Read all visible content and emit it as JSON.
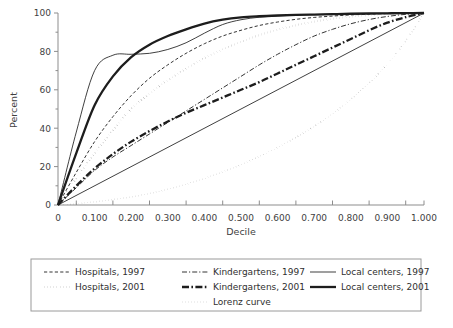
{
  "chart_data": {
    "type": "line",
    "title": "",
    "xlabel": "Decile",
    "ylabel": "Percent",
    "xlim": [
      0,
      1.0
    ],
    "ylim": [
      0,
      100
    ],
    "grid": false,
    "legend_position": "bottom",
    "xticks": [
      "0",
      "0.100",
      "0.200",
      "0.300",
      "0.400",
      "0.500",
      "0.600",
      "0.700",
      "0.800",
      "0.900",
      "1.000"
    ],
    "xtick_values": [
      0,
      0.1,
      0.2,
      0.3,
      0.4,
      0.5,
      0.6,
      0.7,
      0.8,
      0.9,
      1.0
    ],
    "yticks": [
      "0",
      "20",
      "40",
      "60",
      "80",
      "100"
    ],
    "ytick_values": [
      0,
      20,
      40,
      60,
      80,
      100
    ],
    "x": [
      0,
      0.05,
      0.1,
      0.15,
      0.2,
      0.25,
      0.3,
      0.35,
      0.4,
      0.45,
      0.5,
      0.55,
      0.6,
      0.65,
      0.7,
      0.75,
      0.8,
      0.85,
      0.9,
      0.95,
      1.0
    ],
    "series": [
      {
        "name": "Hospitals, 1997",
        "style": "thin-dashed",
        "values": [
          0,
          17,
          33,
          46,
          57,
          66,
          73,
          79,
          84,
          88,
          91,
          93.5,
          95.3,
          96.7,
          97.7,
          98.4,
          99,
          99.4,
          99.7,
          99.9,
          100
        ]
      },
      {
        "name": "Hospitals, 2001",
        "style": "thick-dotted",
        "values": [
          0,
          14,
          27,
          39,
          50,
          58,
          65,
          71,
          76.5,
          81,
          85,
          88.5,
          91.3,
          93.6,
          95.5,
          97,
          98.1,
          98.9,
          99.5,
          99.85,
          100
        ]
      },
      {
        "name": "Kindergartens, 1997",
        "style": "thin-dashdot",
        "values": [
          0,
          9,
          18,
          25,
          31,
          37,
          43,
          49,
          55,
          61,
          67,
          73,
          78.5,
          83.5,
          88,
          91.5,
          94.4,
          96.6,
          98.2,
          99.3,
          100
        ]
      },
      {
        "name": "Kindergartens, 2001",
        "style": "thick-dashdot",
        "values": [
          0,
          10,
          19,
          26.5,
          33,
          38.5,
          43.5,
          48,
          52,
          56,
          60,
          64,
          68.5,
          73,
          77.5,
          82,
          86.5,
          91,
          95,
          97.8,
          100
        ]
      },
      {
        "name": "Local centers, 1997",
        "style": "thin-solid",
        "values": [
          0,
          38,
          70,
          78,
          78.5,
          79,
          81,
          84.5,
          89.5,
          94,
          96.5,
          97.8,
          98.5,
          98.9,
          99.2,
          99.4,
          99.6,
          99.75,
          99.85,
          99.95,
          100
        ]
      },
      {
        "name": "Local centers, 2001",
        "style": "thick-solid",
        "values": [
          0,
          27,
          52,
          67,
          77,
          83.5,
          88,
          91.5,
          94.5,
          96.5,
          97.7,
          98.3,
          98.7,
          99,
          99.2,
          99.4,
          99.6,
          99.75,
          99.85,
          99.95,
          100
        ]
      },
      {
        "name": "Lorenz curve",
        "style": "thin-dotted",
        "values": [
          0,
          0.7,
          1.6,
          2.8,
          4.2,
          6,
          8.2,
          10.8,
          13.8,
          17.2,
          21,
          25.3,
          30,
          35.2,
          41,
          47.5,
          55,
          63.5,
          73.5,
          85.5,
          100
        ]
      }
    ],
    "reference_line": {
      "name": "diagonal",
      "style": "thin-solid",
      "points": [
        [
          0,
          0
        ],
        [
          1.0,
          100
        ]
      ]
    }
  },
  "legend": {
    "items": [
      {
        "label": "Hospitals, 1997",
        "style": "thin-dashed",
        "col": 0,
        "row": 0
      },
      {
        "label": "Hospitals, 2001",
        "style": "thick-dotted",
        "col": 0,
        "row": 1
      },
      {
        "label": "Kindergartens, 1997",
        "style": "thin-dashdot",
        "col": 1,
        "row": 0
      },
      {
        "label": "Kindergartens, 2001",
        "style": "thick-dashdot",
        "col": 1,
        "row": 1
      },
      {
        "label": "Lorenz curve",
        "style": "thin-dotted",
        "col": 1,
        "row": 2
      },
      {
        "label": "Local centers, 1997",
        "style": "thin-solid",
        "col": 2,
        "row": 0
      },
      {
        "label": "Local centers, 2001",
        "style": "thick-solid",
        "col": 2,
        "row": 1
      }
    ]
  },
  "colors": {
    "ink": "#1d1d1d",
    "axis": "#8d8d8d",
    "text": "#3a3a3a",
    "legend_border": "#9a9a9a",
    "background": "#ffffff"
  }
}
